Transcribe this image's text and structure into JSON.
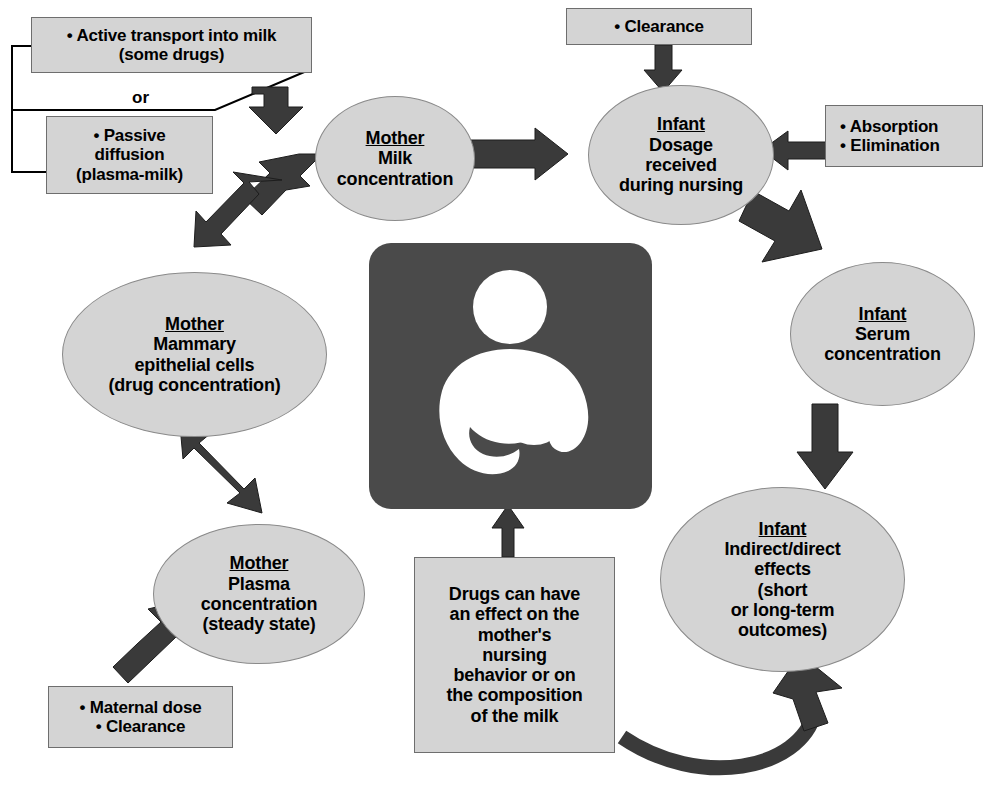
{
  "diagram": {
    "colors": {
      "node_fill": "#d4d4d4",
      "node_stroke": "#8a8a8a",
      "arrow": "#3a3a3a",
      "symbol_bg": "#4a4a4a",
      "symbol_fg": "#ffffff",
      "text": "#000000",
      "background": "#ffffff"
    },
    "connector_label": "or",
    "symbol": {
      "name": "international-breastfeeding-symbol",
      "alt": "Breastfeeding symbol: mother nursing an infant"
    },
    "nodes": [
      {
        "id": "active-transport",
        "shape": "box",
        "lines": [
          "• Active transport into milk",
          "(some drugs)"
        ]
      },
      {
        "id": "passive-diffusion",
        "shape": "box",
        "lines": [
          "• Passive",
          "diffusion",
          "(plasma-milk)"
        ]
      },
      {
        "id": "clearance",
        "shape": "box",
        "lines": [
          "• Clearance"
        ]
      },
      {
        "id": "absorption-elimination",
        "shape": "box",
        "lines": [
          "• Absorption",
          "• Elimination"
        ]
      },
      {
        "id": "maternal-dose",
        "shape": "box",
        "lines": [
          "• Maternal dose",
          "• Clearance"
        ]
      },
      {
        "id": "drug-effect",
        "shape": "box",
        "lines": [
          "Drugs can have",
          "an effect on the",
          "mother's",
          "nursing",
          "behavior or on",
          "the composition",
          "of the milk"
        ]
      },
      {
        "id": "mother-milk",
        "shape": "ellipse",
        "title": "Mother",
        "lines": [
          "Milk",
          "concentration"
        ]
      },
      {
        "id": "infant-dosage",
        "shape": "ellipse",
        "title": "Infant",
        "lines": [
          "Dosage",
          "received",
          "during nursing"
        ]
      },
      {
        "id": "mother-mammary",
        "shape": "ellipse",
        "title": "Mother",
        "lines": [
          "Mammary",
          "epithelial cells",
          "(drug concentration)"
        ]
      },
      {
        "id": "infant-serum",
        "shape": "ellipse",
        "title": "Infant",
        "lines": [
          "Serum",
          "concentration"
        ]
      },
      {
        "id": "mother-plasma",
        "shape": "ellipse",
        "title": "Mother",
        "lines": [
          "Plasma",
          "concentration",
          "(steady state)"
        ]
      },
      {
        "id": "infant-effects",
        "shape": "ellipse",
        "title": "Infant",
        "lines": [
          "Indirect/direct",
          "effects",
          "(short",
          "or long-term",
          "outcomes)"
        ]
      }
    ]
  }
}
